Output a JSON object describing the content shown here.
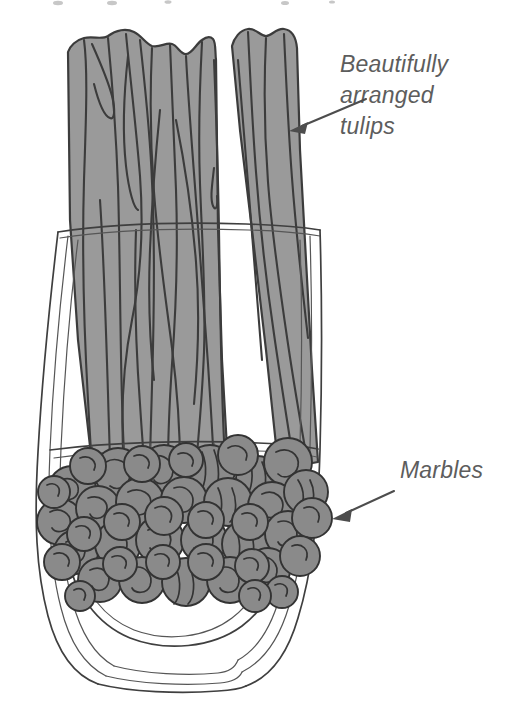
{
  "canvas": {
    "width": 512,
    "height": 702,
    "background_color": "#ffffff"
  },
  "illustration": {
    "title": "Hand-drawn illustration of a glass vase with tulip stems and marbles",
    "subject": "glass vase with tulip stems and marbles"
  },
  "palette": {
    "background": "#ffffff",
    "stem_fill": "#9a9a9a",
    "stem_outline": "#3c3c3c",
    "marble_fill": "#8a8a8a",
    "marble_outline": "#333333",
    "glass_outline": "#3f3f3f",
    "glass_outline_light": "#565656",
    "annotation_text": "#5d5d5d",
    "annotation_arrow": "#4d4d4d"
  },
  "annotations": [
    {
      "id": "tulips",
      "lines": [
        "Beautifully",
        "arranged",
        "tulips"
      ],
      "text": "Beautifully arranged tulips",
      "text_x": 340,
      "text_y": 72,
      "line_height": 31,
      "font_size": 23,
      "font_style": "italic",
      "color": "#5d5d5d",
      "arrow": {
        "from_x": 365,
        "from_y": 100,
        "to_x": 292,
        "to_y": 130,
        "direction": "down-left",
        "target": "tulip-stems"
      }
    },
    {
      "id": "marbles",
      "lines": [
        "Marbles"
      ],
      "text": "Marbles",
      "text_x": 400,
      "text_y": 478,
      "line_height": 31,
      "font_size": 23,
      "font_style": "italic",
      "color": "#5d5d5d",
      "arrow": {
        "from_x": 395,
        "from_y": 492,
        "to_x": 333,
        "to_y": 518,
        "direction": "down-left",
        "target": "marble-pile"
      }
    }
  ],
  "scene_parts": {
    "stems": {
      "label": "tulip stems",
      "count": 9,
      "fill": "#9a9a9a",
      "top_cropped": true,
      "top_y": 18,
      "bottom_y": 470
    },
    "vase": {
      "label": "glass vase",
      "rim_y": 225,
      "rim_left_x": 60,
      "rim_right_x": 318,
      "bottom_y": 686,
      "water_line_y": 445
    },
    "marbles": {
      "label": "marbles",
      "count": 46,
      "fill": "#8a8a8a",
      "region_top_y": 448,
      "region_bottom_y": 600
    }
  },
  "cropped_header": {
    "present": true,
    "note": "faint descenders of a clipped text line at the very top edge"
  }
}
